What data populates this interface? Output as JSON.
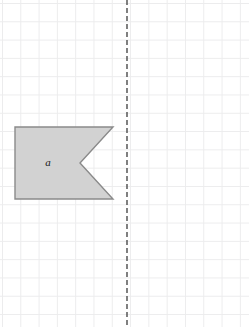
{
  "canvas": {
    "width": 249,
    "height": 327,
    "background_color": "#ffffff",
    "grid": {
      "visible": true,
      "spacing_px": 18.3,
      "line_color": "#ececed"
    }
  },
  "mirror_line": {
    "name": "line of reflection",
    "orientation": "vertical",
    "x": 127,
    "y_start": 0,
    "y_end": 327,
    "style": "dashed",
    "color": "#4a4a4a",
    "dash_pattern": "5,3",
    "width": 1.4
  },
  "shapes": [
    {
      "label": "a",
      "type": "polygon",
      "description": "pentagon with concave notch on right side (arrow-tail / flag shape)",
      "fill_color": "#d2d2d2",
      "stroke_color": "#8a8a8a",
      "stroke_width": 1.4,
      "points": "15,127 113,127 80,163 113,199 15,199",
      "vertices": [
        [
          15,
          127
        ],
        [
          113,
          127
        ],
        [
          80,
          163
        ],
        [
          113,
          199
        ],
        [
          15,
          199
        ]
      ],
      "label_position": [
        48,
        163
      ]
    }
  ]
}
